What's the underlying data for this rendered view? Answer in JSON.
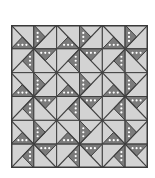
{
  "quilt": {
    "title": "Pinwheel quilt pattern",
    "rows": 6,
    "cols": 6,
    "block_size_cells": 2,
    "colors": {
      "light": "#d3d3d3",
      "dark": "#7b7b7b",
      "dot": "#ffffff",
      "line": "#3f3f3f",
      "border": "#3a3a3a"
    },
    "cell_pattern": {
      "tl": {
        "dark": "bottom",
        "diagonal": "tl-br"
      },
      "tr": {
        "dark": "left",
        "diagonal": "bl-tr"
      },
      "bl": {
        "dark": "right",
        "diagonal": "bl-tr"
      },
      "br": {
        "dark": "top",
        "diagonal": "tl-br"
      }
    }
  }
}
